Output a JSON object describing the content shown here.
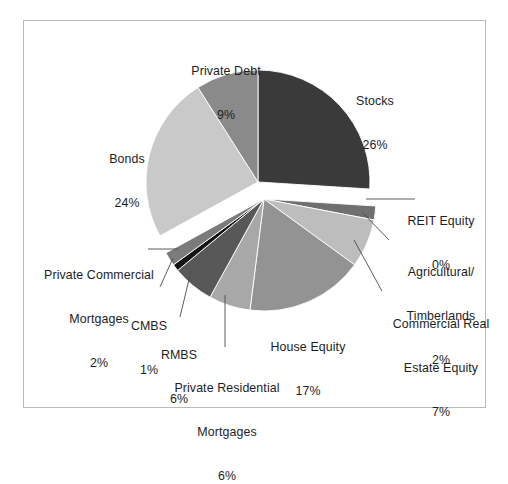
{
  "figure": {
    "frame_border_color": "#b9b9b9",
    "background": "#ffffff"
  },
  "chart_data": {
    "type": "pie",
    "title": "",
    "subtitle": "",
    "xlabel": "",
    "ylabel": "",
    "legend_position": "none",
    "grid": false,
    "total_percent": 100,
    "start_angle_deg": 0,
    "direction": "clockwise",
    "exploded_groups": [
      {
        "name": "upper",
        "slices": [
          "Stocks",
          "Private Debt",
          "Bonds"
        ],
        "offset": "up"
      },
      {
        "name": "lower",
        "slices": [
          "REIT Equity",
          "Agricultural/ Timberlands",
          "Commercial Real Estate Equity",
          "House Equity",
          "Private Residential Mortgages",
          "RMBS",
          "CMBS",
          "Private Commercial Mortgages"
        ],
        "offset": "down"
      }
    ],
    "labels": [
      "Stocks",
      "REIT Equity",
      "Agricultural/ Timberlands",
      "Commercial Real Estate Equity",
      "House Equity",
      "Private Residential Mortgages",
      "RMBS",
      "CMBS",
      "Private Commercial Mortgages",
      "Bonds",
      "Private Debt"
    ],
    "values": [
      26,
      0,
      2,
      7,
      17,
      6,
      6,
      1,
      2,
      24,
      9
    ],
    "value_texts": [
      "26%",
      "0%",
      "2%",
      "7%",
      "17%",
      "6%",
      "6%",
      "1%",
      "2%",
      "24%",
      "9%"
    ],
    "colors": [
      "#3a3a3a",
      "#1c1c1c",
      "#6f6f6f",
      "#bdbdbd",
      "#939393",
      "#a8a8a8",
      "#585858",
      "#141414",
      "#7b7b7b",
      "#c9c9c9",
      "#8a8a8a"
    ],
    "slices": [
      {
        "label": "Stocks",
        "value": 26,
        "value_text": "26%",
        "color": "#3a3a3a"
      },
      {
        "label": "REIT Equity",
        "value": 0,
        "value_text": "0%",
        "color": "#1c1c1c"
      },
      {
        "label": "Agricultural/ Timberlands",
        "value": 2,
        "value_text": "2%",
        "color": "#6f6f6f"
      },
      {
        "label": "Commercial Real Estate Equity",
        "value": 7,
        "value_text": "7%",
        "color": "#bdbdbd"
      },
      {
        "label": "House Equity",
        "value": 17,
        "value_text": "17%",
        "color": "#939393"
      },
      {
        "label": "Private Residential Mortgages",
        "value": 6,
        "value_text": "6%",
        "color": "#a8a8a8"
      },
      {
        "label": "RMBS",
        "value": 6,
        "value_text": "6%",
        "color": "#585858"
      },
      {
        "label": "CMBS",
        "value": 1,
        "value_text": "1%",
        "color": "#141414"
      },
      {
        "label": "Private Commercial Mortgages",
        "value": 2,
        "value_text": "2%",
        "color": "#7b7b7b"
      },
      {
        "label": "Bonds",
        "value": 24,
        "value_text": "24%",
        "color": "#c9c9c9"
      },
      {
        "label": "Private Debt",
        "value": 9,
        "value_text": "9%",
        "color": "#8a8a8a"
      }
    ]
  },
  "callouts": {
    "stocks": {
      "name": "Stocks",
      "pct": "26%"
    },
    "private_debt": {
      "name": "Private Debt",
      "pct": "9%"
    },
    "bonds": {
      "name": "Bonds",
      "pct": "24%"
    },
    "reit_equity": {
      "name": "REIT Equity",
      "pct": "0%"
    },
    "agricultural": {
      "line1": "Agricultural/",
      "line2": "Timberlands",
      "pct": "2%"
    },
    "commercial_real_estate": {
      "line1": "Commercial Real",
      "line2": "Estate Equity",
      "pct": "7%"
    },
    "house_equity": {
      "name": "House Equity",
      "pct": "17%"
    },
    "private_residential": {
      "line1": "Private Residential",
      "line2": "Mortgages",
      "pct": "6%"
    },
    "rmbs": {
      "name": "RMBS",
      "pct": "6%"
    },
    "cmbs": {
      "name": "CMBS",
      "pct": "1%"
    },
    "private_commercial": {
      "line1": "Private Commercial",
      "line2": "Mortgages",
      "pct": "2%"
    }
  }
}
